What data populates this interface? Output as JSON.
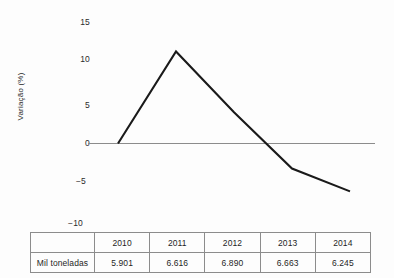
{
  "chart_data": {
    "type": "line",
    "title": "",
    "xlabel": "",
    "ylabel": "Variação (%)",
    "categories": [
      "2010",
      "2011",
      "2012",
      "2013",
      "2014"
    ],
    "series": [
      {
        "name": "Variação (%)",
        "values": [
          0,
          12.1,
          4.1,
          -3.3,
          -6.3
        ]
      }
    ],
    "y_ticks": [
      "15",
      "10",
      "5",
      "0",
      "-5",
      "-10"
    ],
    "y_tick_values": [
      15,
      10,
      5,
      0,
      -5,
      -10
    ],
    "ylim": [
      -10,
      15
    ],
    "grid": false,
    "legend": "none",
    "zero_line": true,
    "line_color": "#1a1a1a",
    "zero_line_color": "#8c8c8c"
  },
  "table": {
    "corner_label": "",
    "columns": [
      "2010",
      "2011",
      "2012",
      "2013",
      "2014"
    ],
    "rows": [
      {
        "label": "Mil toneladas",
        "values": [
          "5.901",
          "6.616",
          "6.890",
          "6.663",
          "6.245"
        ]
      }
    ]
  },
  "axis": {
    "title": "Variação (%)",
    "tick_15": "15",
    "tick_10": "10",
    "tick_5": "5",
    "tick_0": "0",
    "tick_neg5": "−5",
    "tick_neg10": "−10"
  }
}
